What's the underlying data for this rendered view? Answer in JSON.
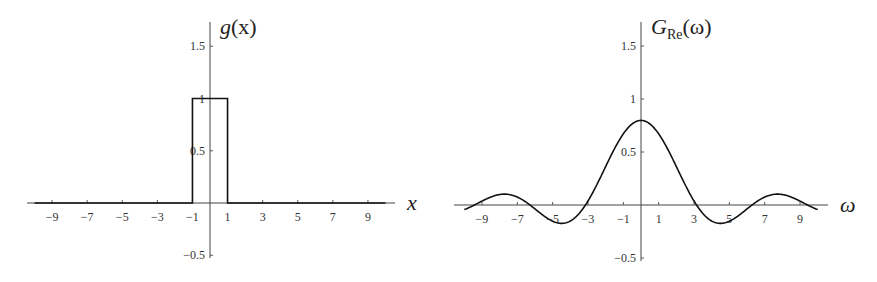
{
  "chart_data": [
    {
      "type": "line",
      "title": "g(x)",
      "xlabel": "x",
      "ylabel": "g(x)",
      "description": "Rectangular pulse: g(x) = 1 for |x| < 1, 0 otherwise",
      "xlim": [
        -10,
        10
      ],
      "ylim": [
        -0.5,
        1.7
      ],
      "x_ticks": [
        -9,
        -7,
        -5,
        -3,
        -1,
        1,
        3,
        5,
        7,
        9
      ],
      "x_tick_labels": [
        "−9",
        "−7",
        "−5",
        "−3",
        "−1",
        "1",
        "3",
        "5",
        "7",
        "9"
      ],
      "y_ticks": [
        -0.5,
        0.5,
        1,
        1.5
      ],
      "y_tick_labels": [
        "−0.5",
        "0.5",
        "1",
        "1.5"
      ],
      "grid": false,
      "series": [
        {
          "name": "g(x)",
          "x": [
            -10,
            -1,
            -1,
            1,
            1,
            10
          ],
          "y": [
            0,
            0,
            1,
            1,
            0,
            0
          ]
        }
      ]
    },
    {
      "type": "line",
      "title": "G_Re(ω)",
      "xlabel": "ω",
      "ylabel": "G_Re(ω)",
      "description": "Real part of Fourier transform: G_Re(ω) ≈ 0.798·sin(ω)/ω",
      "xlim": [
        -10,
        10
      ],
      "ylim": [
        -0.5,
        1.7
      ],
      "x_ticks": [
        -9,
        -7,
        -5,
        -3,
        -1,
        1,
        3,
        5,
        7,
        9
      ],
      "x_tick_labels": [
        "−9",
        "−7",
        "−5",
        "−3",
        "−1",
        "1",
        "3",
        "5",
        "7",
        "9"
      ],
      "y_ticks": [
        -0.5,
        0.5,
        1,
        1.5
      ],
      "y_tick_labels": [
        "−0.5",
        "0.5",
        "1",
        "1.5"
      ],
      "grid": false,
      "amplitude": 0.798,
      "series": [
        {
          "name": "G_Re(ω)",
          "x": [
            -10,
            -9,
            -8,
            -7.7,
            -7,
            -6.28,
            -5,
            -4.49,
            -4,
            -3.14,
            -2,
            -1,
            0,
            1,
            2,
            3.14,
            4,
            4.49,
            5,
            6.28,
            7,
            7.7,
            8,
            9,
            10
          ],
          "y": [
            -0.043,
            0.037,
            0.079,
            0.082,
            0.075,
            0,
            -0.153,
            -0.173,
            -0.151,
            0,
            0.363,
            0.671,
            0.798,
            0.671,
            0.363,
            0,
            -0.151,
            -0.173,
            -0.153,
            0,
            0.075,
            0.082,
            0.079,
            0.037,
            -0.043
          ]
        }
      ]
    }
  ],
  "labels": {
    "left_title_main": "g",
    "left_title_rest": "(x)",
    "left_xlabel": "x",
    "right_title_main": "G",
    "right_title_sub": "Re",
    "right_title_rest": "(ω)",
    "right_xlabel": "ω"
  }
}
